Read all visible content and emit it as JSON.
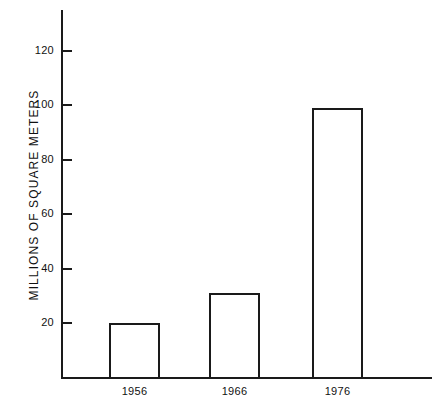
{
  "chart_data": {
    "type": "bar",
    "title": "",
    "xlabel": "",
    "ylabel": "MILLIONS OF SQUARE METERS",
    "categories": [
      "1956",
      "1966",
      "1976"
    ],
    "values": [
      20,
      31,
      99
    ],
    "ylim": [
      0,
      135
    ],
    "yticks": [
      20,
      40,
      60,
      80,
      100,
      120
    ],
    "ytick_labels": [
      "20",
      "40",
      "60",
      "80",
      "100",
      "120"
    ],
    "grid": false,
    "legend": null,
    "bar_style": {
      "fill": "#ffffff",
      "edge": "#1a1a1a",
      "edge_width_px": 2
    },
    "axis_color": "#1a1a1a",
    "background": "#ffffff"
  },
  "axes": {
    "y_axis_name": "y-axis-line",
    "x_axis_name": "x-axis-line"
  }
}
